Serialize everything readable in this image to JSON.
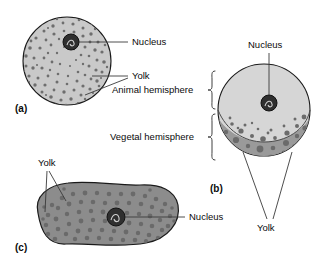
{
  "figure": {
    "background": "#ffffff",
    "width": 336,
    "height": 267
  },
  "colors": {
    "panel_a_fill": "#c9c9c9",
    "panel_a_yolk": "#6e6e6e",
    "animal_hemisphere_fill": "#d6d6d6",
    "vegetal_hemisphere_fill": "#9a9a9a",
    "vegetal_yolk": "#6b6b6b",
    "panel_c_fill": "#8c8c8c",
    "panel_c_yolk": "#6a6a6a",
    "nucleus_fill": "#2f2f2f",
    "outline": "#1a1a1a",
    "leader_line": "#3a3a3a",
    "text": "#0b0b0b"
  },
  "panels": [
    {
      "key": "a",
      "tag": "(a)",
      "name": "isolecithal-egg",
      "description": "Egg with evenly distributed small yolk granules",
      "labels": [
        {
          "text": "Nucleus",
          "name": "nucleus-label-a"
        },
        {
          "text": "Yolk",
          "name": "yolk-label-a"
        }
      ]
    },
    {
      "key": "b",
      "tag": "(b)",
      "name": "telolecithal-egg",
      "description": "Egg with yolk concentrated in the vegetal hemisphere",
      "labels": [
        {
          "text": "Nucleus",
          "name": "nucleus-label-b"
        },
        {
          "text": "Animal hemisphere",
          "name": "animal-hemisphere-label"
        },
        {
          "text": "Vegetal hemisphere",
          "name": "vegetal-hemisphere-label"
        },
        {
          "text": "Yolk",
          "name": "yolk-label-b"
        }
      ]
    },
    {
      "key": "c",
      "tag": "(c)",
      "name": "centrolecithal-egg",
      "description": "Elongated egg with yolk spread through the cytoplasm",
      "labels": [
        {
          "text": "Yolk",
          "name": "yolk-label-c"
        },
        {
          "text": "Nucleus",
          "name": "nucleus-label-c"
        }
      ]
    }
  ],
  "text": {
    "panel_a_tag": "(a)",
    "panel_b_tag": "(b)",
    "panel_c_tag": "(c)",
    "nucleus_a": "Nucleus",
    "yolk_a": "Yolk",
    "nucleus_b": "Nucleus",
    "animal_hemisphere": "Animal hemisphere",
    "vegetal_hemisphere": "Vegetal hemisphere",
    "yolk_b": "Yolk",
    "yolk_c": "Yolk",
    "nucleus_c": "Nucleus"
  }
}
